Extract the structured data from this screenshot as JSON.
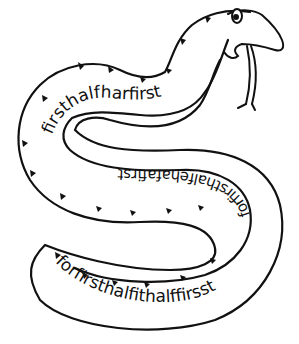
{
  "illustration": {
    "subject": "snake",
    "colors": {
      "ink": "#111111",
      "background": "#ffffff"
    },
    "text_segments": {
      "upper_body": "firsthalfharfirst",
      "left_curve": "alfirsta",
      "middle_body_inverted": "forfirsthalfehafafirst",
      "right_curve": "forfirsthalffirsst",
      "bottom_body": "forfirsthalfithalffirsst"
    },
    "full_text": "forfirsthalfithalffirsstforfirsthalfehafafirstalfirsthalfharfirst"
  }
}
